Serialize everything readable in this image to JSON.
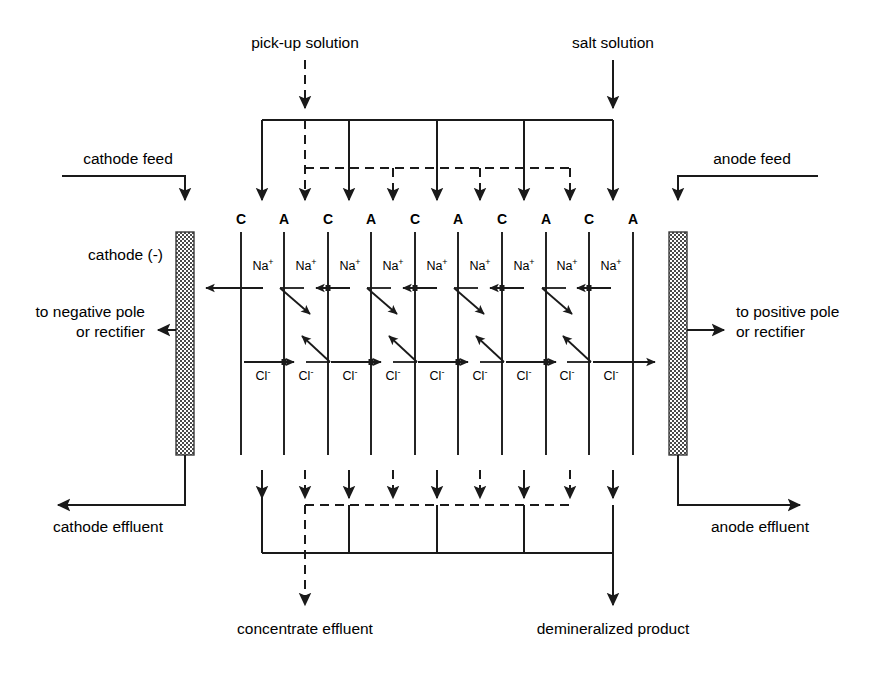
{
  "diagram": {
    "background": "#ffffff",
    "line_color": "#1a1a1a",
    "electrode_fill": "#6b6b6b"
  },
  "labels": {
    "pickup_solution": "pick-up solution",
    "salt_solution": "salt solution",
    "cathode_feed": "cathode feed",
    "anode_feed": "anode feed",
    "cathode": "cathode (-)",
    "negative_pole_line1": "to negative pole",
    "negative_pole_line2": "or rectifier",
    "positive_pole_line1": "to positive pole",
    "positive_pole_line2": "or rectifier",
    "cathode_effluent": "cathode effluent",
    "anode_effluent": "anode effluent",
    "concentrate_effluent": "concentrate effluent",
    "demineralized_product": "demineralized product"
  },
  "membranes": {
    "cation_label": "C",
    "anion_label": "A",
    "sequence": [
      "C",
      "A",
      "C",
      "A",
      "C",
      "A",
      "C",
      "A",
      "C",
      "A"
    ],
    "x_positions": [
      241,
      284,
      328,
      371,
      415,
      458,
      502,
      546,
      589,
      633
    ],
    "top_y": 232,
    "bottom_y": 455
  },
  "ions": {
    "sodium": "Na",
    "sodium_charge": "+",
    "chloride": "Cl",
    "chloride_charge": "-",
    "sodium_label": "Na+",
    "chloride_label": "Cl-",
    "sodium_count": 9,
    "chloride_count": 9,
    "sodium_x": [
      263,
      306,
      350,
      393,
      437,
      480,
      524,
      567,
      611
    ],
    "chloride_x": [
      263,
      306,
      350,
      393,
      437,
      480,
      524,
      567,
      611
    ],
    "sodium_y": 270,
    "chloride_y": 380
  },
  "electrodes": {
    "cathode": {
      "x": 176,
      "y": 232,
      "width": 18,
      "height": 223,
      "polarity": "-"
    },
    "anode": {
      "x": 669,
      "y": 232,
      "width": 18,
      "height": 223,
      "polarity": "+"
    }
  },
  "streams": {
    "solid_name": "salt solution (solid line)",
    "dashed_name": "pick-up solution (dashed line)",
    "top_manifold_y": 120,
    "dashed_manifold_y": 168,
    "bottom_manifold_y": 553,
    "dashed_bottom_manifold_y": 505
  }
}
